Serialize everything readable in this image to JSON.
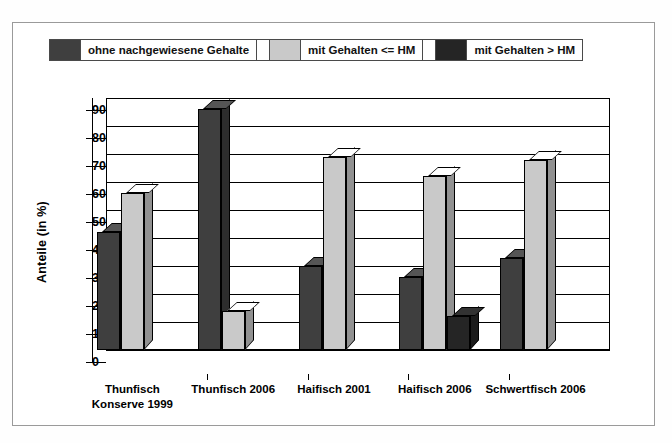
{
  "legend": {
    "items": [
      {
        "label": "ohne nachgewiesene Gehalte",
        "color": "#3f3f3f"
      },
      {
        "label": "mit Gehalten <= HM",
        "color": "#c9c9c9"
      },
      {
        "label": "mit Gehalten > HM",
        "color": "#252525"
      }
    ]
  },
  "axis": {
    "ylabel": "Anteile (in %)",
    "yticks": [
      "0",
      "10",
      "20",
      "30",
      "40",
      "50",
      "60",
      "70",
      "80",
      "90"
    ]
  },
  "chart_data": {
    "type": "bar",
    "title": "",
    "xlabel": "",
    "ylabel": "Anteile (in %)",
    "ylim": [
      0,
      90
    ],
    "ytick_step": 10,
    "grid": true,
    "legend_position": "top",
    "style": "3d-grouped-columns",
    "categories": [
      "Thunfisch Konserve 1999",
      "Thunfisch 2006",
      "Haifisch 2001",
      "Haifisch 2006",
      "Schwertfisch 2006"
    ],
    "series": [
      {
        "name": "ohne nachgewiesene Gehalte",
        "color": "#3f3f3f",
        "values": [
          42,
          86,
          30,
          26,
          33
        ]
      },
      {
        "name": "mit Gehalten <= HM",
        "color": "#c9c9c9",
        "values": [
          56,
          14,
          69,
          62,
          68
        ]
      },
      {
        "name": "mit Gehalten > HM",
        "color": "#252525",
        "values": [
          0,
          0,
          0,
          12,
          0
        ]
      }
    ]
  }
}
